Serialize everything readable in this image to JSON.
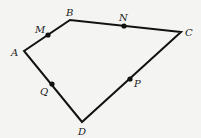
{
  "diagram": {
    "type": "quadrilateral",
    "stroke_color": "#111111",
    "background": "#f4f4f2",
    "vertices": [
      {
        "name": "A",
        "x": 24,
        "y": 51
      },
      {
        "name": "B",
        "x": 70,
        "y": 20
      },
      {
        "name": "C",
        "x": 181,
        "y": 32
      },
      {
        "name": "D",
        "x": 82,
        "y": 122
      }
    ],
    "midpoints": [
      {
        "name": "M",
        "x": 48,
        "y": 35,
        "on_side": "AB"
      },
      {
        "name": "N",
        "x": 124,
        "y": 26,
        "on_side": "BC"
      },
      {
        "name": "P",
        "x": 130,
        "y": 79,
        "on_side": "CD"
      },
      {
        "name": "Q",
        "x": 52,
        "y": 84,
        "on_side": "DA"
      }
    ],
    "labels": {
      "A": "A",
      "B": "B",
      "C": "C",
      "D": "D",
      "M": "M",
      "N": "N",
      "P": "P",
      "Q": "Q"
    }
  }
}
